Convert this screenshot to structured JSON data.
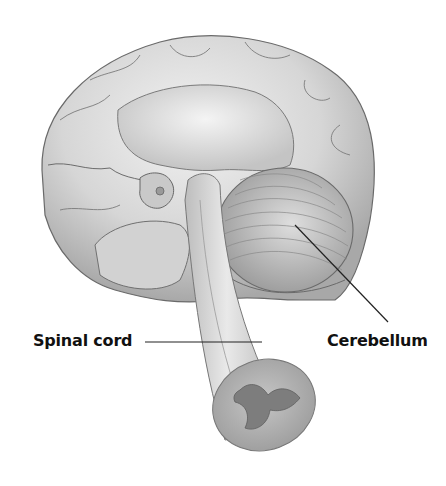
{
  "figure": {
    "labels": [
      {
        "text": "Spinal cord",
        "target": "spinal-cord"
      },
      {
        "text": "Cerebellum",
        "target": "cerebellum"
      }
    ]
  },
  "colors": {
    "background": "#ffffff",
    "tissue_light": "#e6e6e6",
    "tissue_mid": "#c8c8c8",
    "tissue_dark": "#8a8a8a",
    "grey_matter": "#7d7d7d",
    "outline": "#555555",
    "leader_line": "#222222",
    "label_text": "#111111"
  }
}
